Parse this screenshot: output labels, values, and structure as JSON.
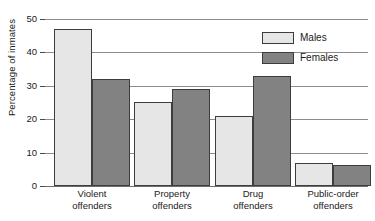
{
  "chart_data": {
    "type": "bar",
    "title": "",
    "subtitle": "",
    "xlabel": "",
    "ylabel": "Percentage of inmates",
    "ylim": [
      0,
      50
    ],
    "y_ticks": [
      0,
      10,
      20,
      30,
      40,
      50
    ],
    "y_tick_labels": [
      "0",
      "10",
      "20",
      "30",
      "40",
      "50"
    ],
    "grid": true,
    "grid_axis": "y",
    "legend_position": "top-right",
    "categories": [
      "Violent offenders",
      "Property offenders",
      "Drug offenders",
      "Public-order offenders"
    ],
    "category_lines": [
      [
        "Violent",
        "offenders"
      ],
      [
        "Property",
        "offenders"
      ],
      [
        "Drug",
        "offenders"
      ],
      [
        "Public-order",
        "offenders"
      ]
    ],
    "series": [
      {
        "name": "Males",
        "color": "#e6e6e6",
        "values": [
          47,
          25,
          21,
          7
        ]
      },
      {
        "name": "Females",
        "color": "#828282",
        "values": [
          32,
          29,
          33,
          6.3
        ]
      }
    ]
  },
  "legend": {
    "items": [
      {
        "label": "Males",
        "swatch": "males"
      },
      {
        "label": "Females",
        "swatch": "females"
      }
    ]
  },
  "axis": {
    "y_title": "Percentage of inmates"
  },
  "colors": {
    "males_fill": "#e6e6e6",
    "females_fill": "#828282",
    "bar_border": "#3d3d3d",
    "gridline": "#8c8c8c",
    "background": "#ffffff",
    "text": "#1a1a1a"
  }
}
